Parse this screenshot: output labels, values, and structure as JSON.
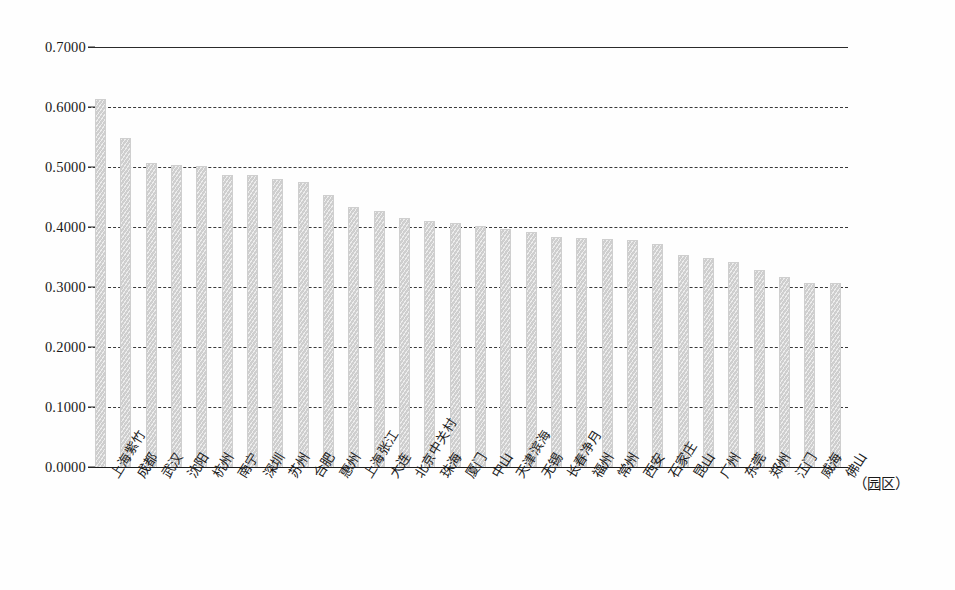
{
  "chart_data": {
    "type": "bar",
    "title": "",
    "subtitle": "",
    "xlabel": "（园区）",
    "ylabel": "",
    "ylim": [
      0.0,
      0.7
    ],
    "ytick_labels": [
      "0.7000",
      "0.6000",
      "0.5000",
      "0.4000",
      "0.3000",
      "0.2000",
      "0.1000",
      "0.0000"
    ],
    "ytick_values": [
      0.7,
      0.6,
      0.5,
      0.4,
      0.3,
      0.2,
      0.1,
      0.0
    ],
    "grid": "horizontal",
    "legend": "none",
    "bar_color": "#d7d7d7",
    "categories": [
      "上海紫竹",
      "成都",
      "武汉",
      "沈阳",
      "杭州",
      "南宁",
      "深圳",
      "苏州",
      "合肥",
      "惠州",
      "上海张江",
      "大连",
      "北京中关村",
      "珠海",
      "厦门",
      "中山",
      "天津滨海",
      "无锡",
      "长春净月",
      "福州",
      "常州",
      "西安",
      "石家庄",
      "昆山",
      "广州",
      "东莞",
      "郑州",
      "江门",
      "威海",
      "佛山"
    ],
    "values": [
      0.613,
      0.548,
      0.507,
      0.503,
      0.502,
      0.486,
      0.486,
      0.48,
      0.475,
      0.453,
      0.434,
      0.426,
      0.415,
      0.41,
      0.406,
      0.401,
      0.396,
      0.392,
      0.383,
      0.381,
      0.38,
      0.378,
      0.371,
      0.354,
      0.348,
      0.342,
      0.329,
      0.317,
      0.307,
      0.306
    ]
  }
}
